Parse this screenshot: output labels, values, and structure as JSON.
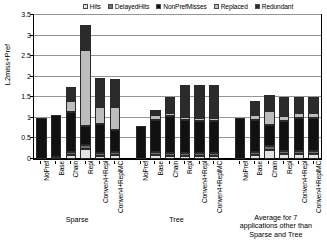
{
  "chart_data": {
    "type": "bar",
    "subtype": "stacked-bar",
    "title": "",
    "xlabel": "",
    "ylabel": "L2miss+Pref",
    "ylim": [
      0,
      3.5
    ],
    "yticks": [
      "0",
      "0.5",
      "1",
      "1.5",
      "2",
      "2.5",
      "3",
      "3.5"
    ],
    "ytick_values": [
      0,
      0.5,
      1,
      1.5,
      2,
      2.5,
      3,
      3.5
    ],
    "grid": true,
    "legend_position": "top",
    "legend": [
      "Hits",
      "DelayedHits",
      "NonPrefMisses",
      "Replaced",
      "Redundant"
    ],
    "series_colors": [
      "#e2e2e2",
      "#6e6e6e",
      "#111111",
      "#bdbdbd",
      "#2b2b2b"
    ],
    "categories": [
      "NoPref",
      "Base",
      "Chain",
      "Repl",
      "Conven4+Repl",
      "Conven4+ReplMC",
      "NoPref",
      "Base",
      "Chain",
      "Repl",
      "Conven4+Repl",
      "Conven4+ReplMC",
      "NoPref",
      "Base",
      "Chain",
      "Repl",
      "Conven4+Repl",
      "Conven4+ReplMC"
    ],
    "groups": [
      {
        "label": "Sparse",
        "start": 0,
        "count": 6
      },
      {
        "label": "Tree",
        "start": 6,
        "count": 6
      },
      {
        "label": "Average for 7\napplications other than\nSparse and Tree",
        "start": 12,
        "count": 6
      }
    ],
    "series": [
      {
        "name": "Hits",
        "values": [
          0.0,
          0.0,
          0.1,
          0.25,
          0.08,
          0.1,
          0.0,
          0.1,
          0.08,
          0.08,
          0.08,
          0.08,
          0.0,
          0.1,
          0.22,
          0.12,
          0.12,
          0.12
        ]
      },
      {
        "name": "DelayedHits",
        "values": [
          0.0,
          0.06,
          0.06,
          0.1,
          0.06,
          0.06,
          0.0,
          0.06,
          0.06,
          0.06,
          0.06,
          0.06,
          0.0,
          0.06,
          0.1,
          0.08,
          0.08,
          0.08
        ]
      },
      {
        "name": "NonPrefMisses",
        "values": [
          1.0,
          1.0,
          0.98,
          0.45,
          0.7,
          0.55,
          0.8,
          0.8,
          0.9,
          0.8,
          0.78,
          0.78,
          1.0,
          0.8,
          0.5,
          0.72,
          0.8,
          0.8
        ]
      },
      {
        "name": "Replaced",
        "values": [
          0.0,
          0.0,
          0.27,
          1.85,
          0.42,
          0.55,
          0.0,
          0.1,
          0.08,
          0.08,
          0.08,
          0.08,
          0.0,
          0.1,
          0.35,
          0.12,
          0.12,
          0.12
        ]
      },
      {
        "name": "Redundant",
        "values": [
          0.0,
          0.0,
          0.34,
          0.6,
          0.71,
          0.69,
          0.0,
          0.14,
          0.38,
          0.78,
          0.8,
          0.8,
          0.0,
          0.34,
          0.38,
          0.46,
          0.38,
          0.38
        ]
      }
    ],
    "totals": [
      1.0,
      1.06,
      1.75,
      3.25,
      1.97,
      1.95,
      0.8,
      1.2,
      1.5,
      1.8,
      1.8,
      1.8,
      1.0,
      1.4,
      1.55,
      1.5,
      1.5,
      1.5
    ]
  }
}
